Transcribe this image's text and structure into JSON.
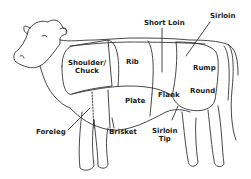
{
  "diagram": {
    "stroke_color": "#333333",
    "background_color": "#ffffff",
    "labels": {
      "short_loin": "Short Loin",
      "sirloin": "Sirloin",
      "shoulder_line1": "Shoulder/",
      "shoulder_line2": "Chuck",
      "rib": "Rib",
      "rump": "Rump",
      "round": "Round",
      "plate": "Plate",
      "flank": "Flank",
      "foreleg": "Foreleg",
      "brisket": "Brisket",
      "sirloin_tip_line1": "Sirloin",
      "sirloin_tip_line2": "Tip"
    }
  }
}
